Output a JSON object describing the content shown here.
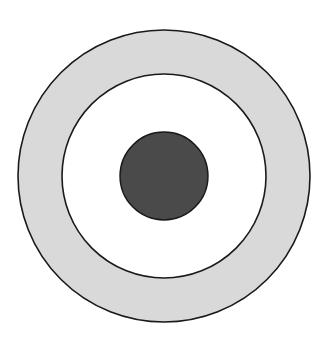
{
  "diagram": {
    "type": "concentric-circles",
    "background": "#ffffff",
    "center": {
      "x": 164,
      "y": 176
    },
    "stroke_color": "#1a1a1a",
    "rings": [
      {
        "name": "outer-ring",
        "radius": 146,
        "fill": "#d9d9d9"
      },
      {
        "name": "middle-circle",
        "radius": 102,
        "fill": "#ffffff"
      },
      {
        "name": "center-dot",
        "radius": 44,
        "fill": "#4a4a4a"
      }
    ]
  }
}
